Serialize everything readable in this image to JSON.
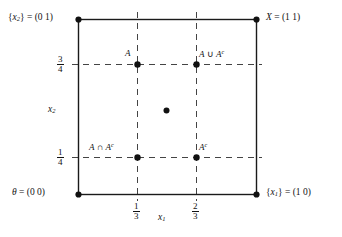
{
  "figure": {
    "type": "diagram",
    "background_color": "#ffffff",
    "ink_color": "#121212",
    "axes": {
      "xlabel": "x_1",
      "xlabel_parts": {
        "base": "x",
        "sub": "1"
      },
      "ylabel": "x_2",
      "ylabel_parts": {
        "base": "x",
        "sub": "2"
      },
      "xlim": [
        0,
        1
      ],
      "ylim": [
        0,
        1
      ],
      "xticks": [
        {
          "value": 0.3333,
          "num": "1",
          "den": "3"
        },
        {
          "value": 0.6667,
          "num": "2",
          "den": "3"
        }
      ],
      "yticks": [
        {
          "value": 0.75,
          "num": "3",
          "den": "4"
        },
        {
          "value": 0.25,
          "num": "1",
          "den": "4"
        }
      ],
      "grid": "dashed"
    },
    "corner_labels": [
      {
        "name": "top-left-corner",
        "text": "{x₂} = (0 1)",
        "base": "{x",
        "sub": "2",
        "tail": "} = (0 1)",
        "x": 0,
        "y": 1
      },
      {
        "name": "top-right-corner",
        "text": "X = (1 1)",
        "base": "X",
        "sub": "",
        "tail": " = (1 1)",
        "x": 1,
        "y": 1
      },
      {
        "name": "bottom-left-corner",
        "text": "θ = (0 0)",
        "base": "θ",
        "sub": "",
        "tail": " = (0 0)",
        "x": 0,
        "y": 0
      },
      {
        "name": "bottom-right-corner",
        "text": "{x₁} = (1 0)",
        "base": "{x",
        "sub": "1",
        "tail": "} = (1 0)",
        "x": 1,
        "y": 0
      }
    ],
    "points": [
      {
        "name": "point-A",
        "label": "A",
        "x": 0.3333,
        "y": 0.75,
        "label_pos": "above-left"
      },
      {
        "name": "point-A-union-Ac",
        "label": "A ∪ Aᶜ",
        "x": 0.6667,
        "y": 0.75,
        "label_pos": "above-right"
      },
      {
        "name": "point-A-intersect-Ac",
        "label": "A ∩ Aᶜ",
        "x": 0.3333,
        "y": 0.25,
        "label_pos": "above-left"
      },
      {
        "name": "point-Ac",
        "label": "Aᶜ",
        "x": 0.6667,
        "y": 0.25,
        "label_pos": "above-right"
      },
      {
        "name": "point-center",
        "label": "",
        "x": 0.5,
        "y": 0.5,
        "label_pos": "none"
      }
    ],
    "corner_points": [
      {
        "name": "corner-point-top-left",
        "x": 0,
        "y": 1
      },
      {
        "name": "corner-point-top-right",
        "x": 1,
        "y": 1
      },
      {
        "name": "corner-point-bottom-left",
        "x": 0,
        "y": 0
      },
      {
        "name": "corner-point-bottom-right",
        "x": 1,
        "y": 0
      }
    ]
  }
}
